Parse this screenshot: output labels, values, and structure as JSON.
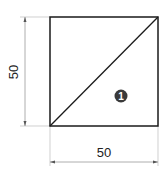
{
  "diagram": {
    "type": "dimensioned-square-drawing",
    "shape": "square with diagonal",
    "dimensions": {
      "height_label": "50",
      "width_label": "50"
    },
    "region_badge": {
      "label": "1"
    },
    "colors": {
      "outline": "#1a1a1a",
      "dimension_line": "#9a9a9a",
      "badge_fill": "#3a3a3a",
      "badge_text": "#ffffff"
    }
  }
}
